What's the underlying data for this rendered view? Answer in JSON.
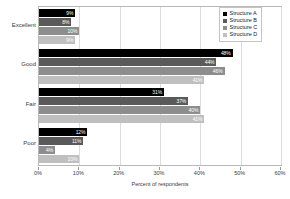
{
  "chart_data": {
    "type": "bar",
    "orientation": "horizontal",
    "title": "",
    "xlabel": "Percent of respondents",
    "ylabel": "",
    "xlim": [
      0,
      60
    ],
    "xticks": [
      "0%",
      "10%",
      "20%",
      "30%",
      "40%",
      "50%",
      "60%"
    ],
    "xtick_values": [
      0,
      10,
      20,
      30,
      40,
      50,
      60
    ],
    "grid": "vertical",
    "legend_position": "top-right",
    "categories": [
      "Excellent",
      "Good",
      "Fair",
      "Poor"
    ],
    "series": [
      {
        "name": "Structure A",
        "color": "#000000",
        "values": [
          9,
          48,
          31,
          12
        ],
        "labels": [
          "9%",
          "48%",
          "31%",
          "12%"
        ]
      },
      {
        "name": "Structure B",
        "color": "#5a5a5a",
        "values": [
          8,
          44,
          37,
          11
        ],
        "labels": [
          "8%",
          "44%",
          "37%",
          "11%"
        ]
      },
      {
        "name": "Structure C",
        "color": "#8d8d8d",
        "values": [
          10,
          46,
          40,
          4
        ],
        "labels": [
          "10%",
          "46%",
          "40%",
          "4%"
        ]
      },
      {
        "name": "Structure D",
        "color": "#bfbfbf",
        "values": [
          9,
          41,
          41,
          10
        ],
        "labels": [
          "9%",
          "41%",
          "41%",
          "10%"
        ]
      }
    ]
  }
}
